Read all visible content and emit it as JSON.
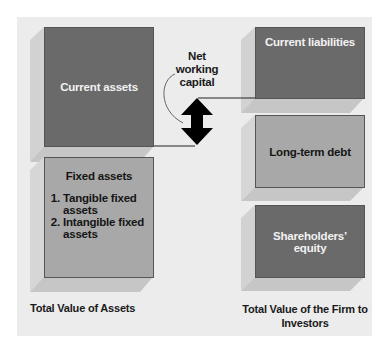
{
  "left": {
    "current_assets": "Current assets",
    "fixed_assets": {
      "title": "Fixed assets",
      "items": [
        "Tangible fixed assets",
        "Intangible fixed assets"
      ]
    },
    "footer": "Total Value of Assets"
  },
  "center": {
    "label": "Net working capital"
  },
  "right": {
    "current_liabilities": "Current liabilities",
    "long_term_debt": "Long-term debt",
    "equity": "Shareholders’ equity",
    "footer": "Total Value of the Firm to Investors"
  },
  "colors": {
    "dark_box": "#6a6a6a",
    "light_box": "#a8a8a8",
    "background": "#ececec",
    "arrow": "#000000"
  }
}
